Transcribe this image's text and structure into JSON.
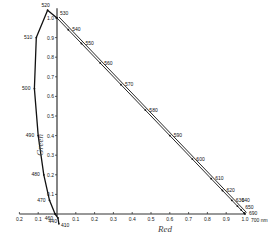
{
  "chart_data": {
    "type": "line",
    "title": "",
    "xlabel": "Red",
    "ylabel": "Green",
    "xlim": [
      -0.2,
      1.0
    ],
    "ylim": [
      -0.05,
      1.05
    ],
    "grid": false,
    "x_ticks": [
      "0.2",
      "0.1",
      "0.1",
      "0.2",
      "0.3",
      "0.4",
      "0.5",
      "0.6",
      "0.7",
      "0.8",
      "0.9",
      "1.0"
    ],
    "x_tick_values": [
      -0.2,
      -0.1,
      0.1,
      0.2,
      0.3,
      0.4,
      0.5,
      0.6,
      0.7,
      0.8,
      0.9,
      1.0
    ],
    "y_ticks": [
      "0.1",
      "0.2",
      "0.3",
      "0.4",
      "0.5",
      "0.6",
      "0.7",
      "0.8",
      "0.9",
      "1.0"
    ],
    "y_tick_values": [
      0.1,
      0.2,
      0.3,
      0.4,
      0.5,
      0.6,
      0.7,
      0.8,
      0.9,
      1.0
    ],
    "series": [
      {
        "name": "Spectral locus",
        "points": [
          {
            "wl": "410",
            "x": 0.01,
            "y": -0.05
          },
          {
            "wl": "440",
            "x": 0.005,
            "y": -0.02
          },
          {
            "wl": "460",
            "x": -0.01,
            "y": 0.0
          },
          {
            "wl": "470",
            "x": -0.04,
            "y": 0.07
          },
          {
            "wl": "480",
            "x": -0.07,
            "y": 0.2
          },
          {
            "wl": "490",
            "x": -0.1,
            "y": 0.4
          },
          {
            "wl": "500",
            "x": -0.12,
            "y": 0.64
          },
          {
            "wl": "510",
            "x": -0.11,
            "y": 0.9
          },
          {
            "wl": "520",
            "x": -0.05,
            "y": 1.04
          },
          {
            "wl": "530",
            "x": 0.0,
            "y": 1.0
          },
          {
            "wl": "540",
            "x": 0.06,
            "y": 0.94
          },
          {
            "wl": "550",
            "x": 0.13,
            "y": 0.87
          },
          {
            "wl": "560",
            "x": 0.23,
            "y": 0.77
          },
          {
            "wl": "570",
            "x": 0.34,
            "y": 0.66
          },
          {
            "wl": "580",
            "x": 0.47,
            "y": 0.53
          },
          {
            "wl": "590",
            "x": 0.6,
            "y": 0.4
          },
          {
            "wl": "600",
            "x": 0.72,
            "y": 0.28
          },
          {
            "wl": "610",
            "x": 0.82,
            "y": 0.18
          },
          {
            "wl": "620",
            "x": 0.88,
            "y": 0.12
          },
          {
            "wl": "630",
            "x": 0.93,
            "y": 0.07
          },
          {
            "wl": "640",
            "x": 0.96,
            "y": 0.04
          },
          {
            "wl": "650",
            "x": 0.98,
            "y": 0.02
          },
          {
            "wl": "690",
            "x": 0.995,
            "y": 0.005
          },
          {
            "wl": "700 nm",
            "x": 1.0,
            "y": 0.0
          }
        ]
      }
    ],
    "annotations": [
      "700 nm"
    ]
  }
}
